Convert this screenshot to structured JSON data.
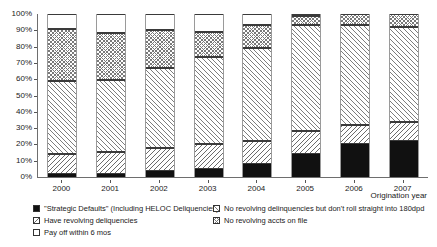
{
  "chart_data": {
    "type": "bar",
    "subtype": "stacked-bar-100-percent",
    "title": "",
    "xlabel": "Origination year",
    "ylabel": "",
    "ylim": [
      0,
      100
    ],
    "ytick_labels": [
      "0%",
      "10%",
      "20%",
      "30%",
      "40%",
      "50%",
      "60%",
      "70%",
      "80%",
      "90%",
      "100%"
    ],
    "ytick_values": [
      0,
      10,
      20,
      30,
      40,
      50,
      60,
      70,
      80,
      90,
      100
    ],
    "grid": false,
    "legend_position": "bottom",
    "categories": [
      "2000",
      "2001",
      "2002",
      "2003",
      "2004",
      "2005",
      "2006",
      "2007"
    ],
    "series": [
      {
        "name": "\"Strategic Defaults\" (Including HELOC Deliquencies)",
        "pattern": "solid-black",
        "values": [
          2,
          2,
          3.5,
          5,
          8,
          14,
          20,
          22
        ]
      },
      {
        "name": "Have revolving deliquencies",
        "pattern": "backslash-hatch",
        "values": [
          12,
          13.5,
          14,
          15,
          14,
          14,
          12,
          12
        ]
      },
      {
        "name": "No revolving delinquencies but don't roll straight into 180dpd",
        "pattern": "slash-hatch",
        "values": [
          45,
          44,
          49.5,
          53.5,
          57,
          65,
          61,
          58
        ]
      },
      {
        "name": "No revolving accts on file",
        "pattern": "crosshatch",
        "values": [
          32,
          29,
          23,
          15.5,
          14,
          6,
          7,
          8
        ]
      },
      {
        "name": "Pay off within 6 mos",
        "pattern": "empty-white",
        "values": [
          9,
          11.5,
          10,
          11,
          7,
          1,
          0,
          0
        ]
      }
    ]
  },
  "axis": {
    "x_title": "Origination year"
  },
  "legend": {
    "items": [
      {
        "label": "\"Strategic Defaults\" (Including HELOC Deliquencies)",
        "pattern": "solid-black",
        "col": 0,
        "row": 0
      },
      {
        "label": "No revolving delinquencies but don't roll straight into 180dpd",
        "pattern": "slash-hatch",
        "col": 1,
        "row": 0
      },
      {
        "label": "Have revolving deliquencies",
        "pattern": "backslash-hatch",
        "col": 0,
        "row": 1
      },
      {
        "label": "No revolving accts on file",
        "pattern": "crosshatch",
        "col": 1,
        "row": 1
      },
      {
        "label": "Pay off within 6 mos",
        "pattern": "empty-white",
        "col": 0,
        "row": 2
      }
    ]
  },
  "colors": {
    "ink": "#1a1a1a",
    "axis": "#6e6e6e",
    "series_black": "#111111",
    "hatch": "#7a7a7a",
    "background": "#ffffff"
  }
}
